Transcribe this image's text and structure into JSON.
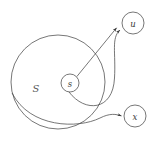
{
  "figure": {
    "width": 158,
    "height": 141,
    "background_color": "#ffffff",
    "stroke_color": "#4a4a4a",
    "stroke_width": 0.75,
    "label_color": "#3a3a3a",
    "set_label_color": "#5a5a5a"
  },
  "set_region": {
    "name": "S",
    "label": "S",
    "cx": 58,
    "cy": 82,
    "r": 47
  },
  "nodes": [
    {
      "id": "s",
      "label": "s",
      "cx": 70,
      "cy": 83,
      "r": 9
    },
    {
      "id": "u",
      "label": "u",
      "cx": 133,
      "cy": 23,
      "r": 11
    },
    {
      "id": "x",
      "label": "x",
      "cx": 135,
      "cy": 116,
      "r": 11
    }
  ],
  "edges": [
    {
      "id": "s-to-u-straight",
      "from": "s",
      "to": "u",
      "style": "straight",
      "arrowhead": true,
      "path": "M 76.5 76.5 L 117.5 26.5"
    },
    {
      "id": "s-to-u-curved",
      "from": "s",
      "to": "u",
      "style": "curved",
      "arrowhead": true,
      "path": "M 69 92 C 85 112 112 112 114 78 C 116 52 112 38 121 29"
    },
    {
      "id": "s-to-x-curved",
      "from": "s",
      "to": "x",
      "style": "curved",
      "arrowhead": true,
      "path": "M 12 93 C 30 128 78 129 100 118 C 110 113 116 114 122 116"
    }
  ],
  "arrowheads": [
    {
      "id": "arrow-u-upper",
      "x": 117.5,
      "y": 26.5,
      "angle": -50
    },
    {
      "id": "arrow-u-lower",
      "x": 121.5,
      "y": 29.5,
      "angle": -42
    },
    {
      "id": "arrow-x-left",
      "x": 122.5,
      "y": 116,
      "angle": 2
    }
  ]
}
